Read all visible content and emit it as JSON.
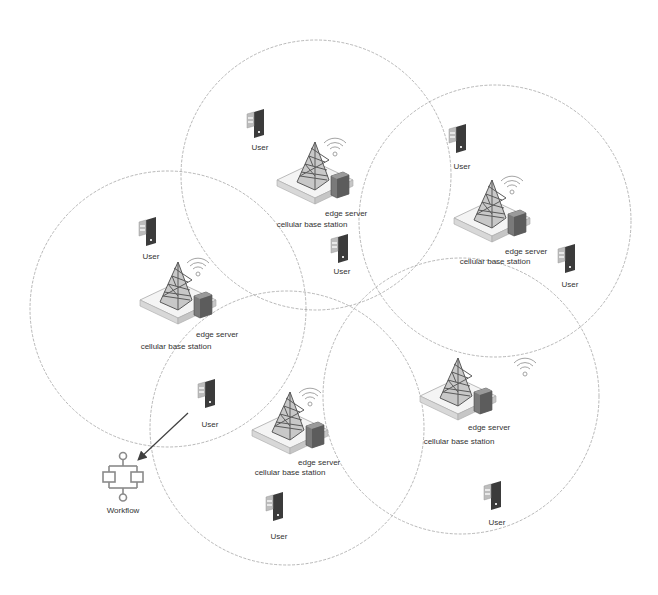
{
  "diagram": {
    "colors": {
      "circle_stroke": "#9a9a9a",
      "tower_stroke": "#5a5a5a",
      "tower_fill": "#c8c8c8",
      "platform_top": "#f4f4f4",
      "platform_side": "#d4d4d4",
      "server_fill": "#6e6e6e",
      "device_dark": "#3b3b3b",
      "device_light": "#b9b9b9",
      "arrow": "#404040",
      "text": "#333333"
    },
    "coverage_areas": [
      {
        "id": "top",
        "cx": 316,
        "cy": 175,
        "r": 135
      },
      {
        "id": "right",
        "cx": 495,
        "cy": 221,
        "r": 136
      },
      {
        "id": "left",
        "cx": 168,
        "cy": 309,
        "r": 138
      },
      {
        "id": "bottom-middle",
        "cx": 287,
        "cy": 428,
        "r": 137
      },
      {
        "id": "bottom-right",
        "cx": 461,
        "cy": 396,
        "r": 138
      }
    ],
    "stations": [
      {
        "id": "top",
        "x": 315,
        "y": 142,
        "wifi_x": 335,
        "wifi_y": 148,
        "server_label": "edge server",
        "station_label": "cellular base station",
        "server_label_x": 340,
        "server_label_y": 214,
        "station_label_x": 312,
        "station_label_y": 224
      },
      {
        "id": "right",
        "x": 492,
        "y": 180,
        "wifi_x": 512,
        "wifi_y": 186,
        "server_label": "edge server",
        "station_label": "cellular base station",
        "server_label_x": 524,
        "server_label_y": 252,
        "station_label_x": 493,
        "station_label_y": 262
      },
      {
        "id": "left",
        "x": 178,
        "y": 262,
        "wifi_x": 198,
        "wifi_y": 268,
        "server_label": "edge server",
        "station_label": "cellular base station",
        "server_label_x": 214,
        "server_label_y": 334,
        "station_label_x": 175,
        "station_label_y": 346
      },
      {
        "id": "bottom-middle",
        "x": 290,
        "y": 392,
        "wifi_x": 310,
        "wifi_y": 398,
        "server_label": "edge server",
        "station_label": "cellular base station",
        "server_label_x": 318,
        "server_label_y": 462,
        "station_label_x": 290,
        "station_label_y": 472
      },
      {
        "id": "bottom-right",
        "x": 458,
        "y": 358,
        "wifi_x": 525,
        "wifi_y": 368,
        "server_label": "edge server",
        "station_label": "cellular base station",
        "server_label_x": 488,
        "server_label_y": 426,
        "station_label_x": 459,
        "station_label_y": 441
      }
    ],
    "users": [
      {
        "label": "User",
        "x": 256,
        "y": 120,
        "label_y": 148
      },
      {
        "label": "User",
        "x": 458,
        "y": 127,
        "label_y": 166
      },
      {
        "label": "User",
        "x": 340,
        "y": 237,
        "label_y": 271
      },
      {
        "label": "User",
        "x": 148,
        "y": 222,
        "label_y": 257
      },
      {
        "label": "User",
        "x": 567,
        "y": 247,
        "label_y": 284
      },
      {
        "label": "User",
        "x": 207,
        "y": 383,
        "label_y": 424
      },
      {
        "label": "User",
        "x": 275,
        "y": 495,
        "label_y": 536
      },
      {
        "label": "User",
        "x": 493,
        "y": 484,
        "label_y": 522
      }
    ],
    "workflow": {
      "label": "Workflow",
      "x": 123,
      "y": 478,
      "label_y": 509
    },
    "arrow": {
      "x1": 188,
      "y1": 413,
      "x2": 139,
      "y2": 459
    }
  },
  "labels": {
    "user": "User",
    "edge_server": "edge server",
    "cellular_base_station": "cellular base station",
    "workflow": "Workflow"
  }
}
